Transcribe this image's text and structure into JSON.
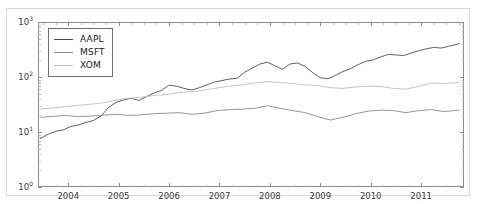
{
  "chart_data": {
    "type": "line",
    "title": "",
    "xlabel": "",
    "ylabel": "",
    "yscale": "log",
    "ylim": [
      1,
      1000
    ],
    "xlim": [
      2003.4,
      2011.85
    ],
    "grid": false,
    "legend_position": "upper left",
    "ytick_labels": [
      "10^0",
      "10^1",
      "10^2",
      "10^3"
    ],
    "ytick_values": [
      1,
      10,
      100,
      1000
    ],
    "xtick_labels": [
      "2004",
      "2005",
      "2006",
      "2007",
      "2008",
      "2009",
      "2010",
      "2011"
    ],
    "xtick_values": [
      2004,
      2005,
      2006,
      2007,
      2008,
      2009,
      2010,
      2011
    ],
    "series": [
      {
        "name": "AAPL",
        "color": "#4d4d4d",
        "x": [
          2003.45,
          2003.6,
          2003.75,
          2003.9,
          2004.05,
          2004.2,
          2004.35,
          2004.5,
          2004.65,
          2004.8,
          2004.95,
          2005.1,
          2005.25,
          2005.4,
          2005.55,
          2005.7,
          2005.85,
          2006.0,
          2006.15,
          2006.3,
          2006.45,
          2006.6,
          2006.75,
          2006.9,
          2007.05,
          2007.2,
          2007.35,
          2007.5,
          2007.65,
          2007.8,
          2007.95,
          2008.1,
          2008.25,
          2008.4,
          2008.55,
          2008.7,
          2008.85,
          2009.0,
          2009.15,
          2009.3,
          2009.45,
          2009.6,
          2009.75,
          2009.9,
          2010.05,
          2010.2,
          2010.35,
          2010.5,
          2010.65,
          2010.8,
          2010.95,
          2011.1,
          2011.25,
          2011.4,
          2011.55,
          2011.75
        ],
        "y": [
          7.6,
          9.1,
          10.3,
          10.9,
          12.6,
          13.4,
          14.9,
          16.2,
          19.5,
          28.0,
          34.5,
          38.5,
          41.0,
          37.5,
          44.0,
          51.0,
          57.0,
          71.0,
          68.0,
          62.0,
          58.0,
          64.0,
          72.0,
          81.0,
          86.0,
          92.0,
          95.0,
          122.0,
          145.0,
          172.0,
          186.0,
          160.0,
          138.0,
          172.0,
          180.0,
          155.0,
          120.0,
          97.0,
          93.0,
          107.0,
          126.0,
          142.0,
          168.0,
          192.0,
          205.0,
          232.0,
          258.0,
          252.0,
          246.0,
          272.0,
          300.0,
          325.0,
          345.0,
          336.0,
          362.0,
          403.0
        ]
      },
      {
        "name": "MSFT",
        "color": "#8a8a8a",
        "x": [
          2003.45,
          2003.7,
          2003.95,
          2004.2,
          2004.45,
          2004.7,
          2004.95,
          2005.2,
          2005.45,
          2005.7,
          2005.95,
          2006.2,
          2006.45,
          2006.7,
          2006.95,
          2007.2,
          2007.45,
          2007.7,
          2007.95,
          2008.2,
          2008.45,
          2008.7,
          2008.95,
          2009.2,
          2009.45,
          2009.7,
          2009.95,
          2010.2,
          2010.45,
          2010.7,
          2010.95,
          2011.2,
          2011.45,
          2011.75
        ],
        "y": [
          18.5,
          19.2,
          20.0,
          19.0,
          19.5,
          20.2,
          21.0,
          20.0,
          20.5,
          21.5,
          22.0,
          22.5,
          21.0,
          22.0,
          24.5,
          25.5,
          26.0,
          27.0,
          30.0,
          27.0,
          24.5,
          22.5,
          19.0,
          16.5,
          18.5,
          21.5,
          24.0,
          25.0,
          24.5,
          22.5,
          24.5,
          25.5,
          23.5,
          25.0
        ]
      },
      {
        "name": "XOM",
        "color": "#bdbdbd",
        "x": [
          2003.45,
          2003.7,
          2003.95,
          2004.2,
          2004.45,
          2004.7,
          2004.95,
          2005.2,
          2005.45,
          2005.7,
          2005.95,
          2006.2,
          2006.45,
          2006.7,
          2006.95,
          2007.2,
          2007.45,
          2007.7,
          2007.95,
          2008.2,
          2008.45,
          2008.7,
          2008.95,
          2009.2,
          2009.45,
          2009.7,
          2009.95,
          2010.2,
          2010.45,
          2010.7,
          2010.95,
          2011.2,
          2011.45,
          2011.75
        ],
        "y": [
          26.0,
          27.5,
          29.0,
          30.5,
          32.0,
          34.0,
          38.0,
          41.0,
          43.0,
          46.0,
          48.0,
          52.0,
          54.0,
          58.0,
          63.0,
          68.0,
          72.0,
          78.0,
          82.0,
          80.0,
          76.0,
          72.0,
          70.0,
          64.0,
          62.0,
          66.0,
          68.0,
          67.0,
          62.0,
          60.0,
          68.0,
          78.0,
          76.0,
          80.0
        ]
      }
    ]
  }
}
